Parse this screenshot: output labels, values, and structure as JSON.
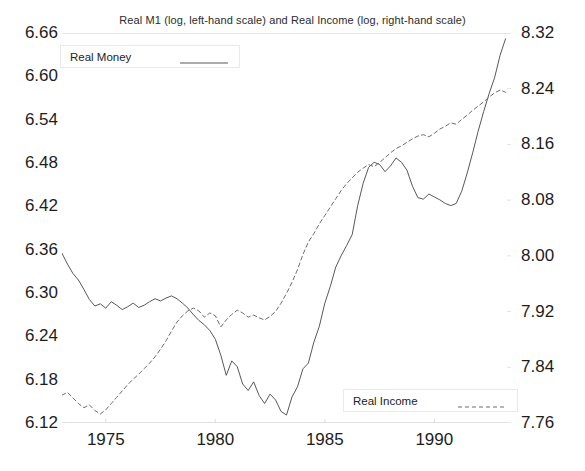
{
  "chart_data": {
    "type": "line",
    "title": "Real M1 (log, left-hand scale) and Real Income (log, right-hand scale)",
    "xlabel": "",
    "ylabel": "",
    "grid": false,
    "legend_position": "inside",
    "xlim": [
      1973.0,
      1993.5
    ],
    "xticks": [
      "1975",
      "1980",
      "1985",
      "1990"
    ],
    "xtick_values": [
      1975,
      1980,
      1985,
      1990
    ],
    "left_axis": {
      "label": "Real M1 (log, left-hand scale)",
      "ylim": [
        6.12,
        6.66
      ],
      "ticks": [
        "6.12",
        "6.18",
        "6.24",
        "6.30",
        "6.36",
        "6.42",
        "6.48",
        "6.54",
        "6.60",
        "6.66"
      ],
      "tick_values": [
        6.12,
        6.18,
        6.24,
        6.3,
        6.36,
        6.42,
        6.48,
        6.54,
        6.6,
        6.66
      ]
    },
    "right_axis": {
      "label": "Real Income (log, right-hand scale)",
      "ylim": [
        7.76,
        8.32
      ],
      "ticks": [
        "7.76",
        "7.84",
        "7.92",
        "8.00",
        "8.08",
        "8.16",
        "8.24",
        "8.32"
      ],
      "tick_values": [
        7.76,
        7.84,
        7.92,
        8.0,
        8.08,
        8.16,
        8.24,
        8.32
      ]
    },
    "series": [
      {
        "name": "Real Money",
        "axis": "left",
        "style": "solid",
        "color": "#55585c",
        "x": [
          1973.0,
          1973.25,
          1973.5,
          1973.75,
          1974.0,
          1974.25,
          1974.5,
          1974.75,
          1975.0,
          1975.25,
          1975.5,
          1975.75,
          1976.0,
          1976.25,
          1976.5,
          1976.75,
          1977.0,
          1977.25,
          1977.5,
          1977.75,
          1978.0,
          1978.25,
          1978.5,
          1978.75,
          1979.0,
          1979.25,
          1979.5,
          1979.75,
          1980.0,
          1980.25,
          1980.5,
          1980.75,
          1981.0,
          1981.25,
          1981.5,
          1981.75,
          1982.0,
          1982.25,
          1982.5,
          1982.75,
          1983.0,
          1983.25,
          1983.5,
          1983.75,
          1984.0,
          1984.25,
          1984.5,
          1984.75,
          1985.0,
          1985.25,
          1985.5,
          1985.75,
          1986.0,
          1986.25,
          1986.5,
          1986.75,
          1987.0,
          1987.25,
          1987.5,
          1987.75,
          1988.0,
          1988.25,
          1988.5,
          1988.75,
          1989.0,
          1989.25,
          1989.5,
          1989.75,
          1990.0,
          1990.25,
          1990.5,
          1990.75,
          1991.0,
          1991.25,
          1991.5,
          1991.75,
          1992.0,
          1992.25,
          1992.5,
          1992.75,
          1993.0,
          1993.25
        ],
        "y": [
          6.355,
          6.34,
          6.327,
          6.318,
          6.305,
          6.291,
          6.282,
          6.285,
          6.279,
          6.288,
          6.283,
          6.277,
          6.281,
          6.286,
          6.28,
          6.283,
          6.288,
          6.292,
          6.289,
          6.293,
          6.296,
          6.292,
          6.286,
          6.279,
          6.27,
          6.262,
          6.256,
          6.248,
          6.236,
          6.214,
          6.186,
          6.206,
          6.198,
          6.174,
          6.165,
          6.177,
          6.158,
          6.147,
          6.16,
          6.152,
          6.136,
          6.131,
          6.156,
          6.17,
          6.195,
          6.203,
          6.232,
          6.254,
          6.286,
          6.309,
          6.336,
          6.352,
          6.366,
          6.381,
          6.421,
          6.452,
          6.474,
          6.481,
          6.478,
          6.468,
          6.476,
          6.487,
          6.481,
          6.47,
          6.448,
          6.432,
          6.43,
          6.437,
          6.433,
          6.429,
          6.424,
          6.421,
          6.424,
          6.441,
          6.466,
          6.494,
          6.524,
          6.551,
          6.576,
          6.598,
          6.629,
          6.652
        ]
      },
      {
        "name": "Real Income",
        "axis": "right",
        "style": "dashed",
        "color": "#6a6d71",
        "x": [
          1973.0,
          1973.25,
          1973.5,
          1973.75,
          1974.0,
          1974.25,
          1974.5,
          1974.75,
          1975.0,
          1975.25,
          1975.5,
          1975.75,
          1976.0,
          1976.25,
          1976.5,
          1976.75,
          1977.0,
          1977.25,
          1977.5,
          1977.75,
          1978.0,
          1978.25,
          1978.5,
          1978.75,
          1979.0,
          1979.25,
          1979.5,
          1979.75,
          1980.0,
          1980.25,
          1980.5,
          1980.75,
          1981.0,
          1981.25,
          1981.5,
          1981.75,
          1982.0,
          1982.25,
          1982.5,
          1982.75,
          1983.0,
          1983.25,
          1983.5,
          1983.75,
          1984.0,
          1984.25,
          1984.5,
          1984.75,
          1985.0,
          1985.25,
          1985.5,
          1985.75,
          1986.0,
          1986.25,
          1986.5,
          1986.75,
          1987.0,
          1987.25,
          1987.5,
          1987.75,
          1988.0,
          1988.25,
          1988.5,
          1988.75,
          1989.0,
          1989.25,
          1989.5,
          1989.75,
          1990.0,
          1990.25,
          1990.5,
          1990.75,
          1991.0,
          1991.25,
          1991.5,
          1991.75,
          1992.0,
          1992.25,
          1992.5,
          1992.75,
          1993.0,
          1993.25
        ],
        "y": [
          7.8,
          7.804,
          7.796,
          7.788,
          7.782,
          7.786,
          7.778,
          7.773,
          7.779,
          7.788,
          7.797,
          7.806,
          7.815,
          7.823,
          7.83,
          7.838,
          7.846,
          7.855,
          7.866,
          7.878,
          7.892,
          7.905,
          7.914,
          7.921,
          7.925,
          7.921,
          7.912,
          7.918,
          7.914,
          7.898,
          7.908,
          7.916,
          7.922,
          7.918,
          7.912,
          7.915,
          7.911,
          7.908,
          7.913,
          7.92,
          7.932,
          7.946,
          7.962,
          7.98,
          8.002,
          8.02,
          8.032,
          8.046,
          8.058,
          8.07,
          8.082,
          8.094,
          8.104,
          8.112,
          8.12,
          8.126,
          8.131,
          8.128,
          8.134,
          8.141,
          8.148,
          8.154,
          8.158,
          8.163,
          8.168,
          8.172,
          8.174,
          8.171,
          8.176,
          8.182,
          8.186,
          8.191,
          8.189,
          8.196,
          8.202,
          8.209,
          8.215,
          8.221,
          8.228,
          8.234,
          8.238,
          8.235
        ]
      }
    ]
  },
  "legend": {
    "money": {
      "label": "Real Money",
      "style": "solid"
    },
    "income": {
      "label": "Real Income",
      "style": "dashed"
    }
  }
}
